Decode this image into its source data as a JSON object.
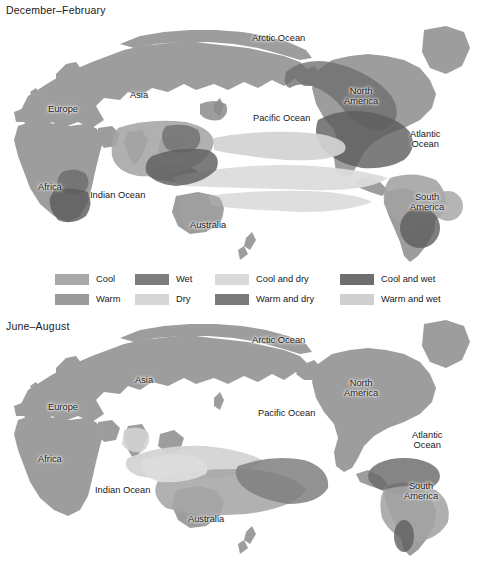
{
  "figure": {
    "kind": "two-panel-world-map",
    "background_color": "#ffffff",
    "land_color": "#9d9d9d",
    "ocean_color": "#ffffff",
    "text_color": "#18181a"
  },
  "panels": [
    {
      "id": "december-february",
      "title": "December–February",
      "labels": [
        {
          "name": "label-arctic-ocean",
          "text": "Arctic Ocean",
          "x": 252,
          "y": 33
        },
        {
          "name": "label-asia",
          "text": "Asia",
          "x": 130,
          "y": 90
        },
        {
          "name": "label-europe",
          "text": "Europe",
          "x": 48,
          "y": 104
        },
        {
          "name": "label-africa",
          "text": "Africa",
          "x": 38,
          "y": 182
        },
        {
          "name": "label-indian-ocean",
          "text": "Indian Ocean",
          "x": 90,
          "y": 190
        },
        {
          "name": "label-australia",
          "text": "Australia",
          "x": 190,
          "y": 220
        },
        {
          "name": "label-pacific-ocean",
          "text": "Pacific Ocean",
          "x": 253,
          "y": 113
        },
        {
          "name": "label-north-america",
          "text": "North\nAmerica",
          "x": 344,
          "y": 86
        },
        {
          "name": "label-atlantic-ocean",
          "text": "Atlantic\nOcean",
          "x": 410,
          "y": 129
        },
        {
          "name": "label-south-america",
          "text": "South\nAmerica",
          "x": 410,
          "y": 192
        }
      ]
    },
    {
      "id": "june-august",
      "title": "June–August",
      "labels": [
        {
          "name": "label-arctic-ocean",
          "text": "Arctic Ocean",
          "x": 252,
          "y": 17
        },
        {
          "name": "label-asia",
          "text": "Asia",
          "x": 135,
          "y": 57
        },
        {
          "name": "label-europe",
          "text": "Europe",
          "x": 48,
          "y": 84
        },
        {
          "name": "label-africa",
          "text": "Africa",
          "x": 38,
          "y": 136
        },
        {
          "name": "label-indian-ocean",
          "text": "Indian Ocean",
          "x": 95,
          "y": 167
        },
        {
          "name": "label-australia",
          "text": "Australia",
          "x": 188,
          "y": 196
        },
        {
          "name": "label-pacific-ocean",
          "text": "Pacific Ocean",
          "x": 258,
          "y": 90
        },
        {
          "name": "label-north-america",
          "text": "North\nAmerica",
          "x": 344,
          "y": 60
        },
        {
          "name": "label-atlantic-ocean",
          "text": "Atlantic\nOcean",
          "x": 412,
          "y": 112
        },
        {
          "name": "label-south-america",
          "text": "South\nAmerica",
          "x": 404,
          "y": 163
        }
      ]
    }
  ],
  "legend": {
    "columns": [
      {
        "x": 55,
        "items": [
          {
            "label": "Cool",
            "color": "#a8a8a8"
          },
          {
            "label": "Warm",
            "color": "#9a9a9a"
          }
        ]
      },
      {
        "x": 135,
        "items": [
          {
            "label": "Wet",
            "color": "#7d7d7d"
          },
          {
            "label": "Dry",
            "color": "#d6d6d6"
          }
        ]
      },
      {
        "x": 215,
        "items": [
          {
            "label": "Cool and dry",
            "color": "#d9d9d9"
          },
          {
            "label": "Warm and dry",
            "color": "#7a7a7a"
          }
        ]
      },
      {
        "x": 340,
        "items": [
          {
            "label": "Cool and wet",
            "color": "#6e6e6e"
          },
          {
            "label": "Warm and wet",
            "color": "#cfcfcf"
          }
        ]
      }
    ]
  }
}
